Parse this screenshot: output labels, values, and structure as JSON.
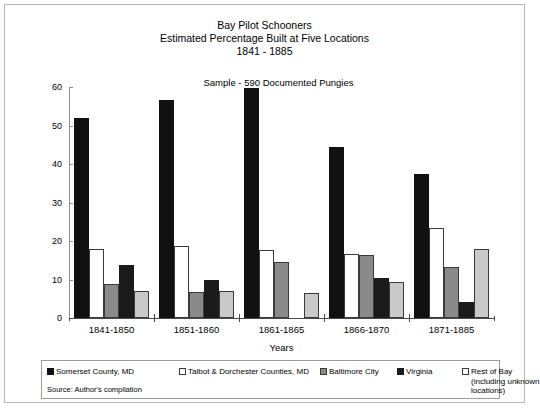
{
  "chart_data": {
    "type": "bar",
    "title": "Bay Pilot Schooners",
    "title_line2": "Estimated Percentage Built at Five Locations",
    "title_line3": "1841 - 1885",
    "subtitle": "Sample - 590 Documented Pungies",
    "xlabel": "Years",
    "ylabel": "Percent Built",
    "ylim": [
      0,
      60
    ],
    "yticks": [
      0,
      10,
      20,
      30,
      40,
      50,
      60
    ],
    "grid": false,
    "legend_position": "bottom",
    "categories": [
      "1841-1850",
      "1851-1860",
      "1861-1865",
      "1866-1870",
      "1871-1885"
    ],
    "series": [
      {
        "name": "Somerset County, MD",
        "color": "#111111",
        "values": [
          52.0,
          56.7,
          59.8,
          44.5,
          37.5
        ]
      },
      {
        "name": "Talbot & Dorchester Counties, MD",
        "color": "#ffffff",
        "values": [
          17.9,
          18.8,
          17.6,
          16.5,
          23.5
        ]
      },
      {
        "name": "Baltimore City",
        "color": "#8a8a8a",
        "values": [
          8.9,
          6.8,
          14.5,
          16.4,
          13.2
        ]
      },
      {
        "name": "Virginia",
        "color": "#1b1b1b",
        "values": [
          13.8,
          9.8,
          0.0,
          10.3,
          4.2
        ]
      },
      {
        "name": "Rest of Bay (including unknown locations)",
        "color": "#c9c9c9",
        "values": [
          6.9,
          6.9,
          6.5,
          9.4,
          18.0
        ]
      }
    ],
    "source": "Source: Author's compilation"
  }
}
